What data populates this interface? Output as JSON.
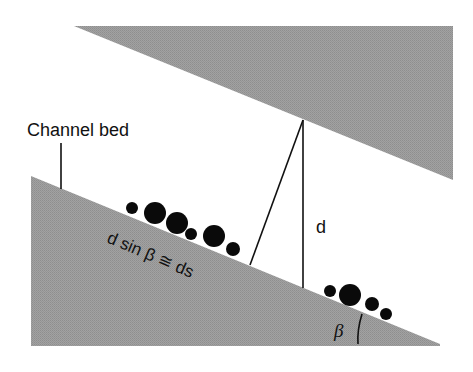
{
  "diagram": {
    "labels": {
      "channel_bed": "Channel bed",
      "depth": "d",
      "slope_relation": "d sin β ≅ ds",
      "angle": "β"
    },
    "colors": {
      "ground": "#9b9b9b",
      "background": "#ffffff",
      "ink": "#111111"
    },
    "angle_degrees": 22
  }
}
